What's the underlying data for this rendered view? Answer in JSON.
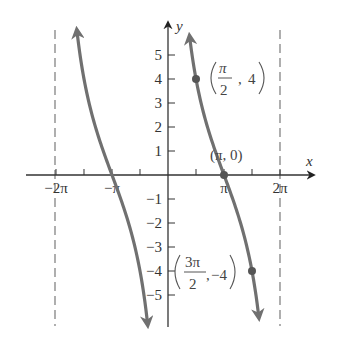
{
  "chart_data": {
    "type": "line",
    "title": "",
    "function": "y = 4 cot(x/2)",
    "xlabel": "x",
    "ylabel": "y",
    "xlim": [
      -7.0,
      7.8
    ],
    "ylim": [
      -6.2,
      6.3
    ],
    "grid": false,
    "legend": null,
    "x_ticks": [
      {
        "value": -6.2832,
        "label": "−2π"
      },
      {
        "value": -4.7124,
        "label": ""
      },
      {
        "value": -3.1416,
        "label": "−π"
      },
      {
        "value": -1.5708,
        "label": ""
      },
      {
        "value": 1.5708,
        "label": ""
      },
      {
        "value": 3.1416,
        "label": "π"
      },
      {
        "value": 4.7124,
        "label": ""
      },
      {
        "value": 6.2832,
        "label": "2π"
      }
    ],
    "y_ticks": [
      {
        "value": 5,
        "label": "5"
      },
      {
        "value": 4,
        "label": "4"
      },
      {
        "value": 3,
        "label": "3"
      },
      {
        "value": 2,
        "label": "2"
      },
      {
        "value": 1,
        "label": "1"
      },
      {
        "value": -1,
        "label": "−1"
      },
      {
        "value": -2,
        "label": "−2"
      },
      {
        "value": -3,
        "label": "−3"
      },
      {
        "value": -4,
        "label": "−4"
      },
      {
        "value": -5,
        "label": "−5"
      }
    ],
    "asymptotes": [
      {
        "x": -6.2832,
        "label": "x = −2π"
      },
      {
        "x": 6.2832,
        "label": "x = 2π"
      }
    ],
    "series": [
      {
        "name": "left branch",
        "domain": [
          -6.2832,
          0
        ],
        "x": [
          -5.73,
          -5.1,
          -4.7124,
          -4.0,
          -3.1416,
          -2.3,
          -1.5708,
          -1.2,
          -0.88
        ],
        "y": [
          5.8,
          3.0,
          1.66,
          0.88,
          0.0,
          -1.69,
          -4.0,
          -5.0,
          -6.0
        ],
        "arrows": "both"
      },
      {
        "name": "right branch",
        "domain": [
          0,
          6.2832
        ],
        "x": [
          0.68,
          1.0,
          1.5708,
          2.3,
          3.1416,
          4.0,
          4.7124,
          5.3,
          5.6
        ],
        "y": [
          5.8,
          7.3,
          4.0,
          1.69,
          0.0,
          -1.69,
          -4.0,
          -5.4,
          -5.8
        ],
        "arrows": "both"
      }
    ],
    "annotations": [
      {
        "point": [
          1.5708,
          4
        ],
        "label_num": "π",
        "label_den": "2",
        "label_y": "4",
        "text": "(π/2, 4)"
      },
      {
        "point": [
          3.1416,
          0
        ],
        "text": "(π, 0)"
      },
      {
        "point": [
          4.7124,
          -4
        ],
        "label_num": "3π",
        "label_den": "2",
        "label_y": "−4",
        "text": "(3π/2, −4)"
      }
    ],
    "colors": {
      "curve": "#707070",
      "axis": "#333333",
      "asymptote": "#7a7a7a",
      "text": "#333333"
    }
  },
  "labels": {
    "x_axis": "x",
    "y_axis": "y",
    "pt1_num": "π",
    "pt1_den": "2",
    "pt1_sep": ",",
    "pt1_y": "4",
    "pt2": "(π, 0)",
    "pt3_num": "3π",
    "pt3_den": "2",
    "pt3_sep": ",",
    "pt3_y": "−4"
  }
}
